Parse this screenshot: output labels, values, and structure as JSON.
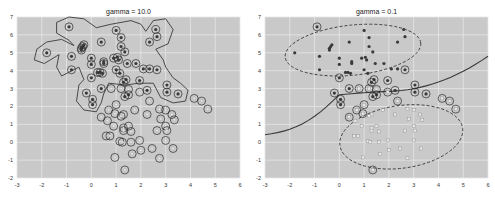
{
  "colors": {
    "plot_bg": "#c9c9c9",
    "grid": "#e6e6e6",
    "dark_point": "#3a3a3a",
    "light_point": "#e8e8e8",
    "ring": "#2a2a2a",
    "boundary": "#3a3a3a"
  },
  "chart_data": [
    {
      "type": "scatter",
      "title": "gamma = 10.0",
      "xlabel": "",
      "ylabel": "",
      "xlim": [
        -3,
        6
      ],
      "ylim": [
        -2,
        7
      ],
      "xticks": [
        "-3",
        "-2",
        "-1",
        "0",
        "1",
        "2",
        "3",
        "4",
        "5",
        "6"
      ],
      "yticks": [
        "-2",
        "-1",
        "0",
        "1",
        "2",
        "3",
        "4",
        "5",
        "6",
        "7"
      ],
      "grid": true,
      "legend": null,
      "annotations": [
        "Solid contour decision boundary (RBF SVM, high gamma) wrapping tightly around dark class",
        "Almost all points circled as support vectors"
      ],
      "series": [
        {
          "name": "class 1 (dark)",
          "marker": "filled dot",
          "points": [
            [
              -0.9,
              6.45
            ],
            [
              -1.8,
              5.0
            ],
            [
              -0.8,
              4.8
            ],
            [
              -0.8,
              4.05
            ],
            [
              -0.4,
              5.25
            ],
            [
              -0.35,
              5.35
            ],
            [
              -0.3,
              5.45
            ],
            [
              -0.4,
              5.15
            ],
            [
              0.0,
              4.7
            ],
            [
              0.0,
              4.35
            ],
            [
              0.4,
              5.6
            ],
            [
              1.0,
              6.25
            ],
            [
              1.2,
              5.85
            ],
            [
              1.2,
              5.35
            ],
            [
              1.35,
              5.05
            ],
            [
              2.35,
              5.6
            ],
            [
              2.6,
              6.3
            ],
            [
              2.65,
              5.9
            ],
            [
              0.5,
              4.5
            ],
            [
              0.5,
              4.4
            ],
            [
              0.35,
              3.9
            ],
            [
              0.25,
              3.9
            ],
            [
              0.45,
              3.85
            ],
            [
              0.0,
              3.6
            ],
            [
              0.9,
              4.7
            ],
            [
              1.05,
              4.75
            ],
            [
              1.1,
              4.6
            ],
            [
              1.0,
              4.05
            ],
            [
              1.15,
              3.85
            ],
            [
              1.45,
              4.4
            ],
            [
              1.8,
              4.4
            ],
            [
              2.1,
              4.1
            ],
            [
              2.35,
              4.1
            ],
            [
              2.65,
              4.05
            ],
            [
              1.4,
              3.5
            ],
            [
              1.3,
              3.35
            ],
            [
              1.95,
              3.45
            ],
            [
              2.25,
              2.9
            ],
            [
              3.05,
              3.2
            ],
            [
              3.05,
              2.8
            ],
            [
              3.5,
              2.7
            ],
            [
              -0.2,
              2.75
            ],
            [
              0.05,
              2.4
            ],
            [
              0.05,
              2.1
            ],
            [
              0.4,
              3.0
            ],
            [
              1.5,
              2.65
            ],
            [
              1.35,
              2.55
            ]
          ]
        },
        {
          "name": "class 0 (light)",
          "marker": "hollow circle",
          "points": [
            [
              0.8,
              3.0
            ],
            [
              1.2,
              3.0
            ],
            [
              1.5,
              2.95
            ],
            [
              1.95,
              2.8
            ],
            [
              2.35,
              2.3
            ],
            [
              4.15,
              2.45
            ],
            [
              4.45,
              2.3
            ],
            [
              4.7,
              1.85
            ],
            [
              1.0,
              2.1
            ],
            [
              0.7,
              1.8
            ],
            [
              0.95,
              1.6
            ],
            [
              0.4,
              1.4
            ],
            [
              0.65,
              1.2
            ],
            [
              1.75,
              1.8
            ],
            [
              2.25,
              1.55
            ],
            [
              2.75,
              1.85
            ],
            [
              3.0,
              1.8
            ],
            [
              2.8,
              1.3
            ],
            [
              3.25,
              1.55
            ],
            [
              3.35,
              1.25
            ],
            [
              1.3,
              1.55
            ],
            [
              1.2,
              1.45
            ],
            [
              0.9,
              0.9
            ],
            [
              1.3,
              0.8
            ],
            [
              1.5,
              0.9
            ],
            [
              1.3,
              0.65
            ],
            [
              1.6,
              0.6
            ],
            [
              2.65,
              0.65
            ],
            [
              3.0,
              0.9
            ],
            [
              3.05,
              0.65
            ],
            [
              0.6,
              0.35
            ],
            [
              0.75,
              0.35
            ],
            [
              1.15,
              0.05
            ],
            [
              1.25,
              0.0
            ],
            [
              1.6,
              0.0
            ],
            [
              1.95,
              0.1
            ],
            [
              3.0,
              0.1
            ],
            [
              1.65,
              -0.65
            ],
            [
              2.0,
              -0.45
            ],
            [
              2.45,
              -0.35
            ],
            [
              3.3,
              -0.35
            ],
            [
              2.75,
              -0.9
            ],
            [
              0.95,
              -0.85
            ],
            [
              1.35,
              -1.55
            ]
          ]
        }
      ]
    },
    {
      "type": "scatter",
      "title": "gamma = 0.1",
      "xlabel": "",
      "ylabel": "",
      "xlim": [
        -3,
        6
      ],
      "ylim": [
        -2,
        7
      ],
      "xticks": [
        "-3",
        "-2",
        "-1",
        "0",
        "1",
        "2",
        "3",
        "4",
        "5",
        "6"
      ],
      "yticks": [
        "-2",
        "-1",
        "0",
        "1",
        "2",
        "3",
        "4",
        "5",
        "6",
        "7"
      ],
      "grid": true,
      "legend": null,
      "annotations": [
        "Solid smooth decision boundary from (-3, 0.2) curving to (6, 4.8)",
        "Dashed ellipse margins enclose each class",
        "Only points near boundary circled as support vectors"
      ],
      "series": [
        {
          "name": "class 1 (dark)",
          "marker": "filled dot",
          "points": [
            [
              -0.9,
              6.45
            ],
            [
              -1.8,
              5.0
            ],
            [
              -0.8,
              4.8
            ],
            [
              -0.8,
              4.05
            ],
            [
              -0.4,
              5.25
            ],
            [
              -0.35,
              5.35
            ],
            [
              -0.3,
              5.45
            ],
            [
              -0.4,
              5.15
            ],
            [
              0.0,
              4.7
            ],
            [
              0.0,
              4.35
            ],
            [
              0.4,
              5.6
            ],
            [
              1.0,
              6.25
            ],
            [
              1.2,
              5.85
            ],
            [
              1.2,
              5.35
            ],
            [
              1.35,
              5.05
            ],
            [
              2.35,
              5.6
            ],
            [
              2.6,
              6.3
            ],
            [
              2.65,
              5.9
            ],
            [
              0.5,
              4.5
            ],
            [
              0.5,
              4.4
            ],
            [
              0.35,
              3.9
            ],
            [
              0.25,
              3.9
            ],
            [
              0.45,
              3.85
            ],
            [
              0.0,
              3.6
            ],
            [
              0.9,
              4.7
            ],
            [
              1.05,
              4.75
            ],
            [
              1.1,
              4.6
            ],
            [
              1.0,
              4.05
            ],
            [
              1.15,
              3.85
            ],
            [
              1.45,
              4.4
            ],
            [
              1.8,
              4.4
            ],
            [
              2.1,
              4.1
            ],
            [
              2.35,
              4.1
            ],
            [
              2.65,
              4.05
            ],
            [
              1.4,
              3.5
            ],
            [
              1.3,
              3.35
            ],
            [
              1.95,
              3.45
            ],
            [
              2.25,
              2.9
            ],
            [
              3.05,
              3.2
            ],
            [
              3.05,
              2.8
            ],
            [
              3.5,
              2.7
            ],
            [
              -0.2,
              2.75
            ],
            [
              0.05,
              2.4
            ],
            [
              0.05,
              2.1
            ],
            [
              0.4,
              3.0
            ],
            [
              1.5,
              2.65
            ],
            [
              1.35,
              2.55
            ]
          ],
          "support_vectors": [
            [
              -0.9,
              6.45
            ],
            [
              0.0,
              3.6
            ],
            [
              2.65,
              4.05
            ],
            [
              1.4,
              3.5
            ],
            [
              1.3,
              3.35
            ],
            [
              1.95,
              3.45
            ],
            [
              2.25,
              2.9
            ],
            [
              3.05,
              3.2
            ],
            [
              3.05,
              2.8
            ],
            [
              3.5,
              2.7
            ],
            [
              -0.2,
              2.75
            ],
            [
              0.05,
              2.4
            ],
            [
              0.05,
              2.1
            ],
            [
              0.4,
              3.0
            ],
            [
              1.5,
              2.65
            ],
            [
              1.35,
              2.55
            ]
          ]
        },
        {
          "name": "class 0 (light)",
          "marker": "hollow square",
          "points": [
            [
              0.8,
              3.0
            ],
            [
              1.2,
              3.0
            ],
            [
              1.5,
              2.95
            ],
            [
              1.95,
              2.8
            ],
            [
              2.35,
              2.3
            ],
            [
              4.15,
              2.45
            ],
            [
              4.45,
              2.3
            ],
            [
              4.7,
              1.85
            ],
            [
              1.0,
              2.1
            ],
            [
              0.7,
              1.8
            ],
            [
              0.95,
              1.6
            ],
            [
              0.4,
              1.4
            ],
            [
              0.65,
              1.2
            ],
            [
              1.75,
              1.8
            ],
            [
              2.25,
              1.55
            ],
            [
              2.75,
              1.85
            ],
            [
              3.0,
              1.8
            ],
            [
              2.8,
              1.3
            ],
            [
              3.25,
              1.55
            ],
            [
              3.35,
              1.25
            ],
            [
              1.3,
              1.55
            ],
            [
              1.2,
              1.45
            ],
            [
              0.9,
              0.9
            ],
            [
              1.3,
              0.8
            ],
            [
              1.5,
              0.9
            ],
            [
              1.3,
              0.65
            ],
            [
              1.6,
              0.6
            ],
            [
              2.65,
              0.65
            ],
            [
              3.0,
              0.9
            ],
            [
              3.05,
              0.65
            ],
            [
              0.6,
              0.35
            ],
            [
              0.75,
              0.35
            ],
            [
              1.15,
              0.05
            ],
            [
              1.25,
              0.0
            ],
            [
              1.6,
              0.0
            ],
            [
              1.95,
              0.1
            ],
            [
              3.0,
              0.1
            ],
            [
              1.65,
              -0.65
            ],
            [
              2.0,
              -0.45
            ],
            [
              2.45,
              -0.35
            ],
            [
              3.3,
              -0.35
            ],
            [
              2.75,
              -0.9
            ],
            [
              0.95,
              -0.85
            ],
            [
              1.35,
              -1.55
            ]
          ],
          "support_vectors": [
            [
              0.8,
              3.0
            ],
            [
              1.2,
              3.0
            ],
            [
              1.5,
              2.95
            ],
            [
              1.95,
              2.8
            ],
            [
              2.35,
              2.3
            ],
            [
              4.15,
              2.45
            ],
            [
              4.45,
              2.3
            ],
            [
              4.7,
              1.85
            ],
            [
              1.0,
              2.1
            ],
            [
              0.7,
              1.8
            ],
            [
              0.95,
              1.6
            ],
            [
              0.4,
              1.4
            ],
            [
              1.35,
              -1.55
            ]
          ]
        }
      ]
    }
  ]
}
